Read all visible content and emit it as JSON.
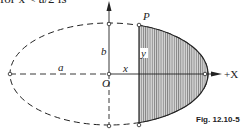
{
  "header_text": "for x < a/2 is",
  "figure": {
    "caption": "Fig. 12.10-5",
    "labels": {
      "point_p": "P",
      "semi_minor": "b",
      "ordinate": "y",
      "semi_major": "a",
      "abscissa": "x",
      "origin": "O",
      "x_axis": "+X"
    },
    "shape": "ellipse",
    "shaded_region": "segment of ellipse to the right of vertical chord at x"
  }
}
